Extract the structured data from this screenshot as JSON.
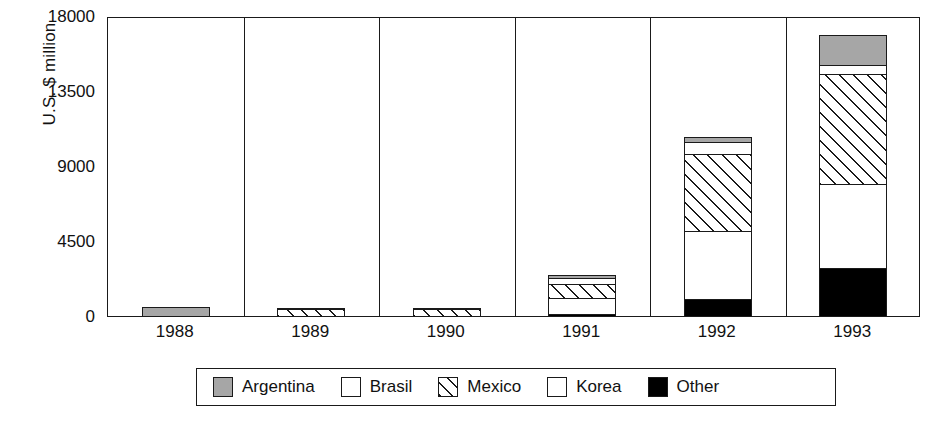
{
  "chart_data": {
    "type": "bar",
    "subtype": "stacked",
    "title": "",
    "xlabel": "",
    "ylabel": "U.S. $ million",
    "categories": [
      "1988",
      "1989",
      "1990",
      "1991",
      "1992",
      "1993"
    ],
    "ylim": [
      0,
      18000
    ],
    "yticks": [
      0,
      4500,
      9000,
      13500,
      18000
    ],
    "ytick_labels": [
      "0",
      "4500",
      "9000",
      "13500",
      "18000"
    ],
    "grid": false,
    "legend_position": "bottom",
    "panel_separators": true,
    "series": [
      {
        "name": "Argentina",
        "color": "#a6a6a6",
        "pattern": "solid-gray",
        "values": [
          600,
          180,
          60,
          240,
          360,
          1925
        ]
      },
      {
        "name": "Brasil",
        "color": "#ffffff",
        "pattern": "solid-white",
        "values": [
          0,
          0,
          120,
          420,
          840,
          600
        ]
      },
      {
        "name": "Mexico",
        "color": "#ffffff",
        "pattern": "diagonal-hatch",
        "values": [
          0,
          480,
          480,
          900,
          4700,
          6685
        ]
      },
      {
        "name": "Korea",
        "color": "#ffffff",
        "pattern": "solid-white",
        "values": [
          0,
          0,
          0,
          1080,
          4155,
          5115
        ]
      },
      {
        "name": "Other",
        "color": "#000000",
        "pattern": "solid-black",
        "values": [
          0,
          0,
          0,
          180,
          1085,
          2950
        ]
      }
    ],
    "totals": [
      600,
      660,
      660,
      2820,
      11140,
      17275
    ]
  },
  "legend": {
    "items": [
      {
        "label": "Argentina",
        "swatch": "sw-argentina"
      },
      {
        "label": "Brasil",
        "swatch": "sw-brasil"
      },
      {
        "label": "Mexico",
        "swatch": "sw-mexico"
      },
      {
        "label": "Korea",
        "swatch": "sw-korea"
      },
      {
        "label": "Other",
        "swatch": "sw-other"
      }
    ]
  }
}
